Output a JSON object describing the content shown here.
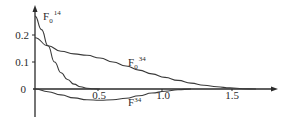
{
  "chart_data": {
    "type": "line",
    "title": "",
    "xlabel": "",
    "ylabel": "",
    "xlim": [
      0,
      1.75
    ],
    "ylim": [
      -0.1,
      0.28
    ],
    "grid": false,
    "legend": "inline labels",
    "x_ticks": [
      "0.5",
      "1.0",
      "1.5"
    ],
    "y_ticks": [
      "0.2",
      "0.1",
      "0"
    ],
    "series": [
      {
        "name": "F0^14",
        "label_main": "F",
        "label_sub": "0",
        "label_sup": "14",
        "x": [
          0,
          0.05,
          0.1,
          0.15,
          0.2,
          0.25,
          0.3,
          0.35,
          0.4,
          0.45,
          0.5
        ],
        "values": [
          0.27,
          0.22,
          0.16,
          0.1,
          0.06,
          0.035,
          0.018,
          0.008,
          0.003,
          0.001,
          0.0
        ]
      },
      {
        "name": "F0^34",
        "label_main": "F",
        "label_sub": "0",
        "label_sup": "34",
        "x": [
          0,
          0.1,
          0.2,
          0.3,
          0.4,
          0.5,
          0.6,
          0.7,
          0.8,
          0.9,
          1.0,
          1.1,
          1.2,
          1.3,
          1.4,
          1.5,
          1.6,
          1.7
        ],
        "values": [
          0.19,
          0.16,
          0.14,
          0.13,
          0.125,
          0.115,
          0.1,
          0.085,
          0.07,
          0.056,
          0.043,
          0.032,
          0.022,
          0.014,
          0.008,
          0.004,
          0.001,
          0.0
        ]
      },
      {
        "name": "F^34",
        "label_main": "F",
        "label_sub": "",
        "label_sup": "34",
        "x": [
          0,
          0.1,
          0.2,
          0.3,
          0.4,
          0.5,
          0.6,
          0.7,
          0.8,
          0.9,
          1.0,
          1.1,
          1.2
        ],
        "values": [
          0.0,
          -0.01,
          -0.022,
          -0.033,
          -0.04,
          -0.042,
          -0.04,
          -0.034,
          -0.025,
          -0.015,
          -0.008,
          -0.003,
          0.0
        ]
      }
    ]
  }
}
